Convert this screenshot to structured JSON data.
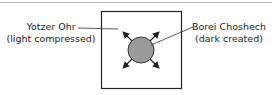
{
  "diagram": {
    "left_label": {
      "line1": "Yotzer Ohr",
      "line2": "(light compressed)"
    },
    "right_label": {
      "line1": "Borei Choshech",
      "line2": "(dark created)"
    },
    "colors": {
      "circle_fill": "#9a9a9a",
      "stroke": "#222222",
      "top_rule": "#b8b8b8"
    },
    "arrows": [
      "up-left",
      "up-right",
      "down-left",
      "down-right"
    ]
  }
}
